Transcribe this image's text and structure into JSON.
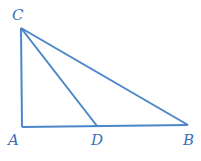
{
  "diagram": {
    "type": "triangle",
    "stroke_color": "#4a86c8",
    "label_color": "#3b6fb6",
    "points": {
      "C": {
        "label": "C",
        "x": 21,
        "y": 28
      },
      "A": {
        "label": "A",
        "x": 22,
        "y": 127
      },
      "D": {
        "label": "D",
        "x": 97,
        "y": 126
      },
      "B": {
        "label": "B",
        "x": 188,
        "y": 125
      }
    },
    "segments": [
      "CA",
      "AB",
      "CB",
      "CD"
    ]
  }
}
